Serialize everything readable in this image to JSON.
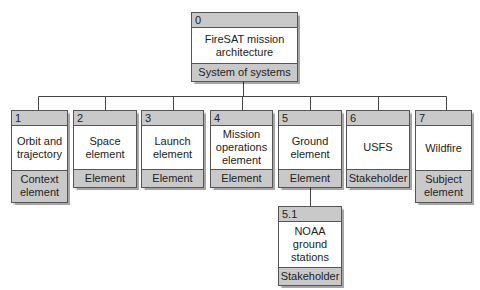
{
  "diagram": {
    "root": {
      "id": "0",
      "title": "FireSAT mission\narchitecture",
      "type": "System of systems"
    },
    "children": [
      {
        "id": "1",
        "title": "Orbit and\ntrajectory",
        "type": "Context\nelement"
      },
      {
        "id": "2",
        "title": "Space\nelement",
        "type": "Element"
      },
      {
        "id": "3",
        "title": "Launch\nelement",
        "type": "Element"
      },
      {
        "id": "4",
        "title": "Mission\noperations\nelement",
        "type": "Element"
      },
      {
        "id": "5",
        "title": "Ground\nelement",
        "type": "Element"
      },
      {
        "id": "6",
        "title": "USFS",
        "type": "Stakeholder"
      },
      {
        "id": "7",
        "title": "Wildfire",
        "type": "Subject\nelement"
      }
    ],
    "grandchildren": [
      {
        "id": "5.1",
        "parent": "5",
        "title": "NOAA\nground\nstations",
        "type": "Stakeholder"
      }
    ],
    "colors": {
      "header_fill": "#c9c9c9",
      "border": "#555555",
      "line": "#444444"
    }
  }
}
